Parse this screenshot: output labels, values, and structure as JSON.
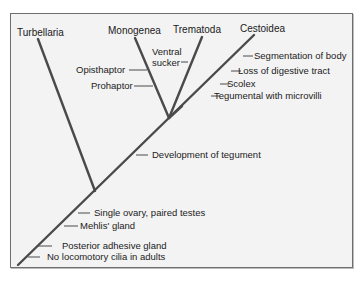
{
  "diagram": {
    "type": "cladogram",
    "taxa": [
      {
        "name": "Turbellaria"
      },
      {
        "name": "Monogenea"
      },
      {
        "name": "Trematoda"
      },
      {
        "name": "Cestoidea"
      }
    ],
    "characters": {
      "cestoidea_branch": [
        "Segmentation of body",
        "Loss of digestive tract",
        "Scolex",
        "Tegumental with microvilli"
      ],
      "trematoda_branch": [
        "Ventral",
        "sucker"
      ],
      "monogenea_branch": [
        "Opisthaptor",
        "Prohaptor"
      ],
      "neodermata_stem": [
        "Development of tegument"
      ],
      "main_stem": [
        "Single ovary, paired testes",
        "Mehlis' gland",
        "Posterior adhesive gland",
        "No locomotory cilia in adults"
      ]
    },
    "colors": {
      "line": "#4a4a4a",
      "background": "#f3f3f3",
      "border": "#6e6e6e"
    }
  }
}
